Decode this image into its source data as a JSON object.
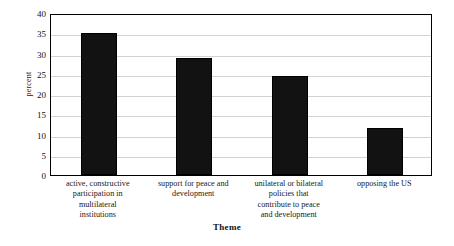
{
  "chart_data": {
    "type": "bar",
    "title": "",
    "xlabel": "Theme",
    "ylabel": "percent",
    "categories": [
      "active, constructive participation in multilateral institutions",
      "support for peace and development",
      "unilateral or bilateral policies that contribute to peace and development",
      "opposing the US"
    ],
    "category_lines": [
      [
        "active, constructive",
        "participation in",
        "multilateral",
        "institutions"
      ],
      [
        "support for peace and",
        "development"
      ],
      [
        "unilateral or bilateral",
        "policies that",
        "contribute to peace",
        "and development"
      ],
      [
        "opposing the US"
      ]
    ],
    "values": [
      35,
      29,
      24.5,
      11.5
    ],
    "ylim": [
      0,
      40
    ],
    "yticks": [
      0,
      5,
      10,
      15,
      20,
      25,
      30,
      35,
      40
    ],
    "ytick_labels": [
      "0",
      "5",
      "10",
      "15",
      "20",
      "25",
      "30",
      "35",
      "40"
    ],
    "grid": true,
    "legend": "none",
    "bar_color": "#121212",
    "grid_color": "#d2d2d2",
    "axis_color": "#000000"
  }
}
